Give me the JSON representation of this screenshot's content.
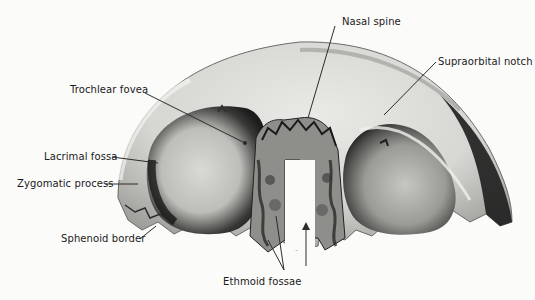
{
  "figure": {
    "labels": {
      "nasal_spine": "Nasal spine",
      "supraorbital_notch": "Supraorbital notch",
      "trochlear_fovea": "Trochlear fovea",
      "lacrimal_fossa": "Lacrimal fossa",
      "zygomatic_process": "Zygomatic process",
      "sphenoid_border": "Sphenoid border",
      "ethmoid_fossae": "Ethmoid fossae"
    },
    "colors": {
      "background": "#fbfbfa",
      "bone_light": "#e6e6e2",
      "bone_mid": "#b8b8b4",
      "bone_dark": "#2a2a2a",
      "leader_line": "#2b2b2b",
      "label_text": "#1a1a1a"
    }
  }
}
